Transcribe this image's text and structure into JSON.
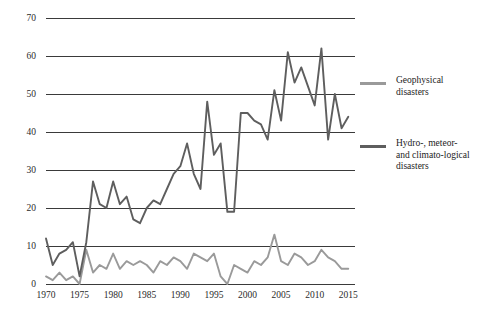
{
  "chart_data": {
    "type": "line",
    "title": "",
    "xlabel": "",
    "ylabel": "",
    "xlim": [
      1970,
      2016
    ],
    "ylim": [
      0,
      70
    ],
    "ytick_step": 10,
    "xtick_step": 5,
    "grid": "horizontal",
    "legend_position": "right",
    "yticks": [
      0,
      10,
      20,
      30,
      40,
      50,
      60,
      70
    ],
    "xticks": [
      1970,
      1975,
      1980,
      1985,
      1990,
      1995,
      2000,
      2005,
      2010,
      2015
    ],
    "x": [
      1970,
      1971,
      1972,
      1973,
      1974,
      1975,
      1976,
      1977,
      1978,
      1979,
      1980,
      1981,
      1982,
      1983,
      1984,
      1985,
      1986,
      1987,
      1988,
      1989,
      1990,
      1991,
      1992,
      1993,
      1994,
      1995,
      1996,
      1997,
      1998,
      1999,
      2000,
      2001,
      2002,
      2003,
      2004,
      2005,
      2006,
      2007,
      2008,
      2009,
      2010,
      2011,
      2012,
      2013,
      2014,
      2015
    ],
    "series": [
      {
        "name": "Geophysical disasters",
        "color": "#9a9a9a",
        "values": [
          2,
          1,
          3,
          1,
          2,
          0,
          9,
          3,
          5,
          4,
          8,
          4,
          6,
          5,
          6,
          5,
          3,
          6,
          5,
          7,
          6,
          4,
          8,
          7,
          6,
          8,
          2,
          0,
          5,
          4,
          3,
          6,
          5,
          7,
          13,
          6,
          5,
          8,
          7,
          5,
          6,
          9,
          7,
          6,
          4,
          4
        ]
      },
      {
        "name": "Hydro-, meteor- and climato-logical disasters",
        "color": "#5e5e5e",
        "values": [
          12,
          5,
          8,
          9,
          11,
          2,
          11,
          27,
          21,
          20,
          27,
          21,
          23,
          17,
          16,
          20,
          22,
          21,
          25,
          29,
          31,
          37,
          29,
          25,
          48,
          34,
          37,
          19,
          19,
          45,
          45,
          43,
          42,
          38,
          51,
          43,
          61,
          53,
          57,
          52,
          47,
          62,
          38,
          50,
          41,
          44
        ]
      }
    ]
  },
  "legend": {
    "entries": [
      {
        "label_line1": "Geophysical",
        "label_line2": "disasters",
        "label_line3": ""
      },
      {
        "label_line1": "Hydro-, meteor-",
        "label_line2": "and climato-logical",
        "label_line3": "disasters"
      }
    ]
  },
  "axis": {
    "y_tick_labels": [
      "70",
      "60",
      "50",
      "40",
      "30",
      "20",
      "10",
      "0"
    ],
    "x_tick_labels": [
      "1970",
      "1975",
      "1980",
      "1985",
      "1990",
      "1995",
      "2000",
      "2005",
      "2010",
      "2015"
    ]
  },
  "colors": {
    "geophysical": "#9a9a9a",
    "hydro": "#5e5e5e",
    "gridline": "#3a3a3a",
    "text": "#1c1c1c"
  }
}
